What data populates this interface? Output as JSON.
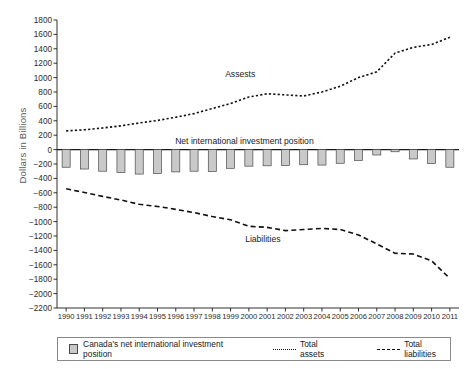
{
  "chart_data": {
    "type": "bar",
    "title": "",
    "xlabel": "",
    "ylabel": "Dollars in Billions",
    "ylim": [
      -2200,
      1800
    ],
    "ytick_step": 200,
    "grid": false,
    "legend_position": "bottom",
    "categories": [
      "1990",
      "1991",
      "1992",
      "1993",
      "1994",
      "1995",
      "1996",
      "1997",
      "1998",
      "1999",
      "2000",
      "2001",
      "2002",
      "2003",
      "2004",
      "2005",
      "2006",
      "2007",
      "2008",
      "2009",
      "2010",
      "2011"
    ],
    "yticks": [
      "1800",
      "1600",
      "1400",
      "1200",
      "1000",
      "800",
      "600",
      "400",
      "200",
      "0",
      "-200",
      "-400",
      "-600",
      "-800",
      "-1000",
      "-1200",
      "-1400",
      "-1600",
      "-1800",
      "-2000",
      "-2200"
    ],
    "series": [
      {
        "name": "Canada's net international investment position",
        "type": "bar",
        "color": "#c9c9c9",
        "edge_color": "#4a4a4a",
        "values": [
          -245,
          -270,
          -300,
          -320,
          -340,
          -330,
          -310,
          -300,
          -305,
          -260,
          -230,
          -225,
          -220,
          -210,
          -215,
          -190,
          -150,
          -75,
          -30,
          -130,
          -195,
          -245
        ]
      },
      {
        "name": "Total assets",
        "type": "line",
        "style": "dotted",
        "color": "#111111",
        "label_on_plot": "Assests",
        "values": [
          260,
          275,
          300,
          330,
          370,
          405,
          450,
          500,
          570,
          640,
          730,
          775,
          760,
          745,
          800,
          880,
          1000,
          1080,
          1340,
          1420,
          1460,
          1560
        ]
      },
      {
        "name": "Total liabilities",
        "type": "line",
        "style": "dashed",
        "color": "#111111",
        "label_on_plot": "Liabilities",
        "values": [
          -545,
          -595,
          -650,
          -700,
          -760,
          -790,
          -830,
          -875,
          -930,
          -975,
          -1065,
          -1080,
          -1125,
          -1110,
          -1095,
          -1110,
          -1185,
          -1310,
          -1440,
          -1450,
          -1545,
          -1790
        ]
      }
    ],
    "annotations": [
      {
        "name": "assets-label",
        "text": "Assests",
        "x": 2001.0,
        "y": 1040
      },
      {
        "name": "nip-label",
        "text": "Net international investment position",
        "x": 2001.0,
        "y": 105
      },
      {
        "name": "liabilities-label",
        "text": "Liabilities",
        "x": 2001.2,
        "y": -1250
      }
    ]
  },
  "legend": {
    "items": [
      {
        "label": "Canada's net international investment position",
        "marker": "square-swatch"
      },
      {
        "label": "Total assets",
        "marker": "dotted-line"
      },
      {
        "label": "Total liabilities",
        "marker": "dashed-line"
      }
    ]
  }
}
